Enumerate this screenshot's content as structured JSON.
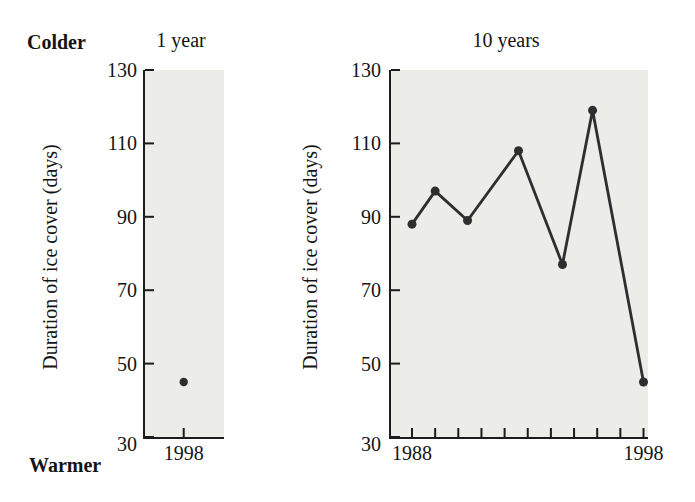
{
  "labels": {
    "colder": "Colder",
    "warmer": "Warmer"
  },
  "colors": {
    "plot_bg": "#ECECE9",
    "axis": "#1C1C1C",
    "text": "#141414",
    "series": "#2E2E2E"
  },
  "chart_data": [
    {
      "id": "one-year",
      "type": "scatter",
      "title": "1 year",
      "xlabel": "",
      "ylabel": "Duration of ice cover (days)",
      "ylim": [
        30,
        130
      ],
      "yticks": [
        130,
        110,
        90,
        70,
        50,
        30
      ],
      "grid": "off",
      "legend": "none",
      "xticks": [
        {
          "label": "1998",
          "pos_frac": 0.49
        }
      ],
      "points": [
        {
          "year": 1998,
          "days": 45,
          "pos_frac": 0.49
        }
      ]
    },
    {
      "id": "ten-years",
      "type": "line",
      "title": "10 years",
      "xlabel": "",
      "ylabel": "Duration of ice cover (days)",
      "ylim": [
        30,
        130
      ],
      "yticks": [
        130,
        110,
        90,
        70,
        50,
        30
      ],
      "grid": "off",
      "legend": "none",
      "x_axis": {
        "range_years": [
          1988,
          1998
        ],
        "tick_years": [
          1988,
          1989,
          1990,
          1991,
          1992,
          1993,
          1994,
          1995,
          1996,
          1997,
          1998
        ],
        "labeled_ticks": [
          {
            "year": 1988,
            "label": "1988"
          },
          {
            "year": 1998,
            "label": "1998"
          }
        ]
      },
      "points": [
        {
          "year": 1988,
          "days": 88
        },
        {
          "year": 1989,
          "days": 97
        },
        {
          "year": 1990.4,
          "days": 89
        },
        {
          "year": 1992.6,
          "days": 108
        },
        {
          "year": 1994.5,
          "days": 77
        },
        {
          "year": 1995.8,
          "days": 119
        },
        {
          "year": 1998,
          "days": 45
        }
      ]
    }
  ]
}
